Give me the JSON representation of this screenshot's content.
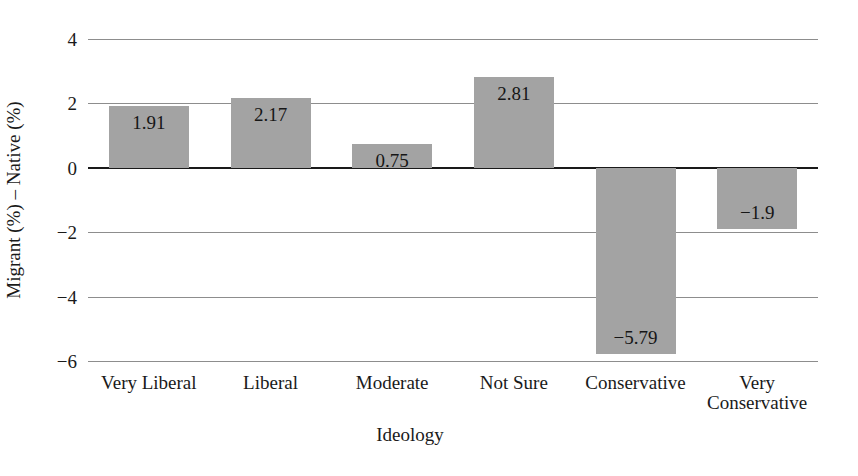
{
  "chart_data": {
    "type": "bar",
    "title": "",
    "subtitle": "",
    "xlabel": "Ideology",
    "ylabel": "Migrant (%) – Native (%)",
    "categories": [
      "Very Liberal",
      "Liberal",
      "Moderate",
      "Not Sure",
      "Conservative",
      "Very\nConservative"
    ],
    "values": [
      1.91,
      2.17,
      0.75,
      2.81,
      -5.79,
      -1.9
    ],
    "value_labels": [
      "1.91",
      "2.17",
      "0.75",
      "2.81",
      "−5.79",
      "−1.9"
    ],
    "ylim": [
      -6,
      4
    ],
    "yticks": [
      4,
      2,
      0,
      -2,
      -4,
      -6
    ],
    "ytick_labels": [
      "4",
      "2",
      "0",
      "−2",
      "−4",
      "−6"
    ],
    "grid": "horizontal",
    "legend": "none",
    "bar_color": "#a3a3a3",
    "grid_color": "#8d8d8d",
    "zero_line_color": "#1a1a1a",
    "background_color": "#ffffff",
    "text_color": "#1a1a1a"
  },
  "axes": {
    "y_title": "Migrant (%) – Native (%)",
    "x_title": "Ideology"
  }
}
